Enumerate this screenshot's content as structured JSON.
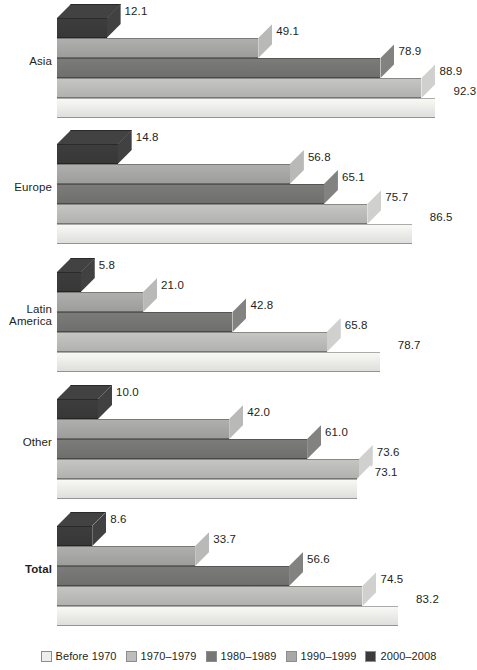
{
  "chart_data": {
    "type": "bar",
    "orientation": "horizontal",
    "style": "3d-grouped-horizontal-bars",
    "title": "",
    "subtitle": "",
    "xlabel": "",
    "ylabel": "",
    "grid": false,
    "axis_visible": false,
    "tick_labels": [],
    "xlim": [
      0,
      100
    ],
    "value_label_format": "one-decimal",
    "legend": {
      "position": "bottom",
      "entries": [
        {
          "label": "Before 1970",
          "color": "#eeeeec"
        },
        {
          "label": "1970–1979",
          "color": "#bdbdbb"
        },
        {
          "label": "1980–1989",
          "color": "#767674"
        },
        {
          "label": "1990–1999",
          "color": "#a8a8a6"
        },
        {
          "label": "2000–2008",
          "color": "#3b3b3b"
        }
      ]
    },
    "categories": [
      "Asia",
      "Europe",
      "Latin America",
      "Other",
      "Total"
    ],
    "series": [
      {
        "name": "2000–2008",
        "color": "#3b3b3b",
        "values": [
          12.1,
          14.8,
          5.8,
          10.0,
          8.6
        ]
      },
      {
        "name": "1990–1999",
        "color": "#a8a8a6",
        "values": [
          49.1,
          56.8,
          21.0,
          42.0,
          33.7
        ]
      },
      {
        "name": "1980–1989",
        "color": "#767674",
        "values": [
          78.9,
          65.1,
          42.8,
          61.0,
          56.6
        ]
      },
      {
        "name": "1970–1979",
        "color": "#bdbdbb",
        "values": [
          88.9,
          75.7,
          65.8,
          73.6,
          74.5
        ]
      },
      {
        "name": "Before 1970",
        "color": "#eeeeec",
        "values": [
          92.3,
          86.5,
          78.7,
          73.1,
          83.2
        ]
      }
    ]
  },
  "groups": [
    {
      "label": "Asia",
      "label_lines": [
        "Asia"
      ],
      "bold": false,
      "bars": [
        {
          "series": "2000–2008",
          "value": 12.1,
          "value_text": "12.1",
          "color": "#3b3b3b"
        },
        {
          "series": "1990–1999",
          "value": 49.1,
          "value_text": "49.1",
          "color": "#a8a8a6"
        },
        {
          "series": "1980–1989",
          "value": 78.9,
          "value_text": "78.9",
          "color": "#767674"
        },
        {
          "series": "1970–1979",
          "value": 88.9,
          "value_text": "88.9",
          "color": "#bdbdbb"
        },
        {
          "series": "Before 1970",
          "value": 92.3,
          "value_text": "92.3",
          "color": "#eeeeec"
        }
      ]
    },
    {
      "label": "Europe",
      "label_lines": [
        "Europe"
      ],
      "bold": false,
      "bars": [
        {
          "series": "2000–2008",
          "value": 14.8,
          "value_text": "14.8",
          "color": "#3b3b3b"
        },
        {
          "series": "1990–1999",
          "value": 56.8,
          "value_text": "56.8",
          "color": "#a8a8a6"
        },
        {
          "series": "1980–1989",
          "value": 65.1,
          "value_text": "65.1",
          "color": "#767674"
        },
        {
          "series": "1970–1979",
          "value": 75.7,
          "value_text": "75.7",
          "color": "#bdbdbb"
        },
        {
          "series": "Before 1970",
          "value": 86.5,
          "value_text": "86.5",
          "color": "#eeeeec"
        }
      ]
    },
    {
      "label": "Latin America",
      "label_lines": [
        "Latin",
        "America"
      ],
      "bold": false,
      "bars": [
        {
          "series": "2000–2008",
          "value": 5.8,
          "value_text": "5.8",
          "color": "#3b3b3b"
        },
        {
          "series": "1990–1999",
          "value": 21.0,
          "value_text": "21.0",
          "color": "#a8a8a6"
        },
        {
          "series": "1980–1989",
          "value": 42.8,
          "value_text": "42.8",
          "color": "#767674"
        },
        {
          "series": "1970–1979",
          "value": 65.8,
          "value_text": "65.8",
          "color": "#bdbdbb"
        },
        {
          "series": "Before 1970",
          "value": 78.7,
          "value_text": "78.7",
          "color": "#eeeeec"
        }
      ]
    },
    {
      "label": "Other",
      "label_lines": [
        "Other"
      ],
      "bold": false,
      "bars": [
        {
          "series": "2000–2008",
          "value": 10.0,
          "value_text": "10.0",
          "color": "#3b3b3b"
        },
        {
          "series": "1990–1999",
          "value": 42.0,
          "value_text": "42.0",
          "color": "#a8a8a6"
        },
        {
          "series": "1980–1989",
          "value": 61.0,
          "value_text": "61.0",
          "color": "#767674"
        },
        {
          "series": "1970–1979",
          "value": 73.6,
          "value_text": "73.6",
          "color": "#bdbdbb"
        },
        {
          "series": "Before 1970",
          "value": 73.1,
          "value_text": "73.1",
          "color": "#eeeeec"
        }
      ]
    },
    {
      "label": "Total",
      "label_lines": [
        "Total"
      ],
      "bold": true,
      "bars": [
        {
          "series": "2000–2008",
          "value": 8.6,
          "value_text": "8.6",
          "color": "#3b3b3b"
        },
        {
          "series": "1990–1999",
          "value": 33.7,
          "value_text": "33.7",
          "color": "#a8a8a6"
        },
        {
          "series": "1980–1989",
          "value": 56.6,
          "value_text": "56.6",
          "color": "#767674"
        },
        {
          "series": "1970–1979",
          "value": 74.5,
          "value_text": "74.5",
          "color": "#bdbdbb"
        },
        {
          "series": "Before 1970",
          "value": 83.2,
          "value_text": "83.2",
          "color": "#eeeeec"
        }
      ]
    }
  ],
  "legend": {
    "items": [
      {
        "label": "Before 1970",
        "color": "#eeeeec"
      },
      {
        "label": "1970–1979",
        "color": "#bdbdbb"
      },
      {
        "label": "1980–1989",
        "color": "#767674"
      },
      {
        "label": "1990–1999",
        "color": "#a8a8a6"
      },
      {
        "label": "2000–2008",
        "color": "#3b3b3b"
      }
    ]
  }
}
